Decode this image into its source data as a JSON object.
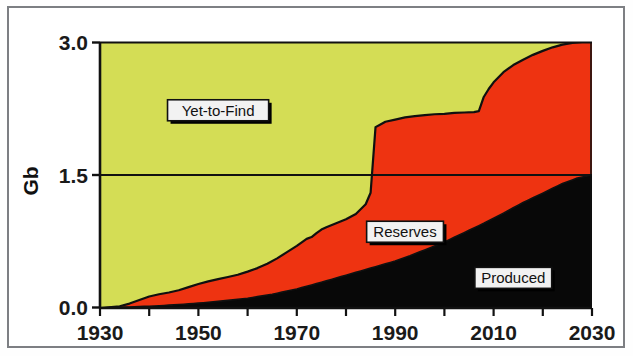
{
  "chart_data": {
    "type": "area",
    "title": "",
    "subtitle": "",
    "xlabel": "",
    "ylabel": "Gb",
    "xlim": [
      1930,
      2030
    ],
    "ylim": [
      0.0,
      3.0
    ],
    "xticks": [
      1930,
      1950,
      1970,
      1990,
      2010,
      2030
    ],
    "xtick_labels": [
      "1930",
      "1950",
      "1970",
      "1990",
      "2010",
      "2030"
    ],
    "x_minor_ticks": [
      1940,
      1960,
      1980,
      2000,
      2020
    ],
    "yticks": [
      0.0,
      1.5,
      3.0
    ],
    "ytick_labels": [
      "0.0",
      "1.5",
      "3.0"
    ],
    "grid": false,
    "legend_position": "inline-annotations",
    "stacked": true,
    "total_constant": 3.0,
    "annotations": [
      {
        "text": "Yet-to-Find",
        "x": 1954,
        "y": 2.23,
        "style": "boxed-white-shadow"
      },
      {
        "text": "Reserves",
        "x": 1992,
        "y": 0.86,
        "style": "boxed-white-shadow"
      },
      {
        "text": "Produced",
        "x": 2014,
        "y": 0.34,
        "style": "boxed-white-shadow"
      }
    ],
    "series": [
      {
        "name": "Produced",
        "color": "#080808",
        "order": 1,
        "x": [
          1930,
          1935,
          1940,
          1945,
          1950,
          1955,
          1960,
          1965,
          1970,
          1975,
          1980,
          1985,
          1990,
          1993,
          1996,
          2000,
          2004,
          2008,
          2012,
          2016,
          2020,
          2024,
          2027,
          2030
        ],
        "values": [
          0.0,
          0.01,
          0.02,
          0.035,
          0.055,
          0.08,
          0.11,
          0.155,
          0.215,
          0.29,
          0.37,
          0.45,
          0.53,
          0.59,
          0.655,
          0.745,
          0.85,
          0.955,
          1.07,
          1.19,
          1.295,
          1.405,
          1.465,
          1.5
        ]
      },
      {
        "name": "Reserves",
        "color": "#ee3311",
        "order": 2,
        "x": [
          1930,
          1934,
          1936,
          1938,
          1940,
          1942,
          1944,
          1946,
          1948,
          1950,
          1952,
          1954,
          1956,
          1958,
          1960,
          1962,
          1964,
          1966,
          1968,
          1970,
          1971,
          1972,
          1973,
          1974,
          1975,
          1976,
          1978,
          1980,
          1982,
          1984,
          1985,
          1986,
          1987,
          1988,
          1990,
          1992,
          1994,
          1996,
          1998,
          2000,
          2002,
          2004,
          2006,
          2007,
          2008,
          2009,
          2010,
          2012,
          2014,
          2016,
          2018,
          2020,
          2022,
          2024,
          2026,
          2028,
          2030
        ],
        "cumulative_top": [
          0.0,
          0.02,
          0.05,
          0.09,
          0.13,
          0.155,
          0.175,
          0.2,
          0.235,
          0.27,
          0.3,
          0.325,
          0.35,
          0.375,
          0.41,
          0.45,
          0.5,
          0.56,
          0.63,
          0.7,
          0.74,
          0.78,
          0.8,
          0.845,
          0.885,
          0.91,
          0.955,
          1.0,
          1.06,
          1.17,
          1.3,
          2.04,
          2.07,
          2.1,
          2.125,
          2.15,
          2.165,
          2.175,
          2.185,
          2.19,
          2.2,
          2.205,
          2.21,
          2.22,
          2.38,
          2.47,
          2.545,
          2.66,
          2.74,
          2.8,
          2.855,
          2.9,
          2.94,
          2.97,
          2.99,
          3.0,
          3.0
        ]
      },
      {
        "name": "Yet-to-Find",
        "color": "#d4dd55",
        "order": 3,
        "cumulative_top_constant": 3.0,
        "note": "Fills remainder up to 3.0; vanishes near 2028"
      }
    ]
  },
  "axes": {
    "y_axis_title": "Gb",
    "y_tick_values": [
      "3.0",
      "1.5",
      "0.0"
    ],
    "x_tick_values": [
      "1930",
      "1950",
      "1970",
      "1990",
      "2010",
      "2030"
    ]
  },
  "labels": {
    "yet_to_find": "Yet-to-Find",
    "reserves": "Reserves",
    "produced": "Produced"
  },
  "colors": {
    "yet_to_find": "#d4dd55",
    "reserves": "#ee3311",
    "produced": "#080808",
    "axis": "#111111",
    "frame": "#7d7f83",
    "background": "#ffffff",
    "label_box_fill": "#f2f2f2",
    "label_box_border": "#111111"
  }
}
